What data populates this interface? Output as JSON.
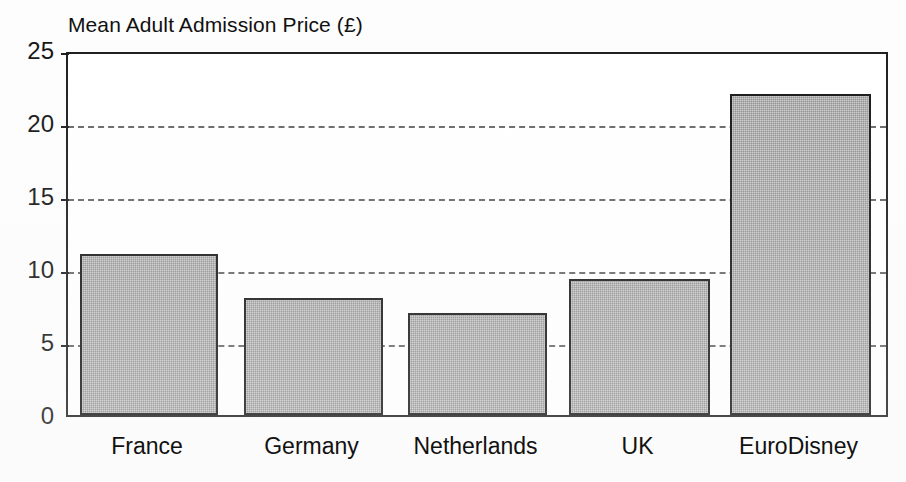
{
  "chart_data": {
    "type": "bar",
    "title": "Mean Adult Admission Price (£)",
    "xlabel": "",
    "ylabel": "",
    "categories": [
      "France",
      "Germany",
      "Netherlands",
      "UK",
      "EuroDisney"
    ],
    "values": [
      11,
      8,
      7,
      9.3,
      22
    ],
    "ylim": [
      0,
      25
    ],
    "ytick_labels": [
      "0",
      "5",
      "10",
      "15",
      "20",
      "25"
    ],
    "ytick_values": [
      0,
      5,
      10,
      15,
      20,
      25
    ],
    "grid": true,
    "grid_axis": "y",
    "grid_style": "dashed",
    "legend": false,
    "legend_position": "none",
    "series": [
      {
        "name": "Mean Adult Admission Price",
        "values": [
          11,
          8,
          7,
          9.3,
          22
        ]
      }
    ],
    "bar_fill_color": "#8d8d8d",
    "bar_edge_color": "#141414",
    "axis_color": "#1a1a1a",
    "grid_color": "#555555",
    "background_color": "#ffffff",
    "text_color": "#111111"
  }
}
